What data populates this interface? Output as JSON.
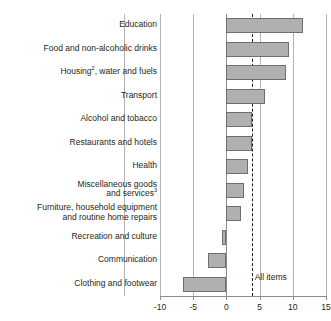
{
  "title_remnant": "· ·",
  "axis": {
    "ticks": [
      -10,
      -5,
      0,
      5,
      10,
      15
    ],
    "tick_labels": [
      "-10",
      "-5",
      "0",
      "5",
      "10",
      "15"
    ],
    "xmin": -10,
    "xmax": 15
  },
  "average": {
    "label": "All items",
    "value": 3.8
  },
  "chart_data": {
    "type": "bar",
    "orientation": "horizontal",
    "title": "",
    "subtitle": "",
    "xlabel": "",
    "ylabel": "",
    "xlim": [
      -10,
      15
    ],
    "grid": true,
    "legend": false,
    "categories": [
      "Education",
      "Food and non-alcoholic drinks",
      "Housing², water and fuels",
      "Transport",
      "Alcohol and tobacco",
      "Restaurants and hotels",
      "Health",
      "Miscellaneous goods\nand services³",
      "Furniture, household equipment\nand routine home repairs",
      "Recreation and culture",
      "Communication",
      "Clothing and footwear"
    ],
    "values": [
      11.6,
      9.4,
      9.0,
      5.8,
      3.8,
      3.8,
      3.3,
      2.7,
      2.2,
      -0.6,
      -2.7,
      -6.6
    ],
    "annotations": [
      {
        "label": "All items",
        "value": 3.8,
        "style": "dashed-vertical-line"
      }
    ],
    "series": [
      {
        "name": "Percentage change",
        "values": [
          11.6,
          9.4,
          9.0,
          5.8,
          3.8,
          3.8,
          3.3,
          2.7,
          2.2,
          -0.6,
          -2.7,
          -6.6
        ]
      }
    ]
  },
  "rows": [
    {
      "label": "Education",
      "value": 11.6,
      "lines": 1
    },
    {
      "label": "Food and non-alcoholic drinks",
      "value": 9.4,
      "lines": 1
    },
    {
      "label": "Housing",
      "sup": "2",
      "label_tail": ", water and fuels",
      "value": 9.0,
      "lines": 1
    },
    {
      "label": "Transport",
      "value": 5.8,
      "lines": 1
    },
    {
      "label": "Alcohol and tobacco",
      "value": 3.8,
      "lines": 1
    },
    {
      "label": "Restaurants and hotels",
      "value": 3.8,
      "lines": 1
    },
    {
      "label": "Health",
      "value": 3.3,
      "lines": 1
    },
    {
      "label": "Miscellaneous goods\nand services",
      "sup": "3",
      "value": 2.7,
      "lines": 2
    },
    {
      "label": "Furniture, household equipment\nand routine home repairs",
      "value": 2.2,
      "lines": 2
    },
    {
      "label": "Recreation and culture",
      "value": -0.6,
      "lines": 1
    },
    {
      "label": "Communication",
      "value": -2.7,
      "lines": 1
    },
    {
      "label": "Clothing and footwear",
      "value": -6.6,
      "lines": 1
    }
  ],
  "colors": {
    "bar_fill": "#b0b0b0",
    "bar_stroke": "#6e6e6e",
    "grid": "#b3b3b3",
    "axis": "#8c8c8c",
    "text": "#231f20"
  }
}
